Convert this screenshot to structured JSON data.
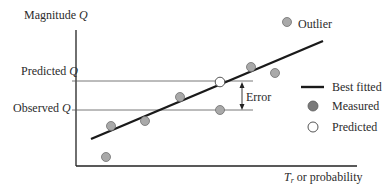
{
  "diagram": {
    "y_axis_label": "Magnitude",
    "y_axis_var": "Q",
    "x_axis_label_var": "T",
    "x_axis_label_sub": "r",
    "x_axis_label_rest": " or probability",
    "predicted_q_label": "Predicted",
    "observed_q_label": "Observed",
    "q_var": "Q",
    "error_label": "Error",
    "outlier_label": "Outlier",
    "legend": {
      "best_fitted": "Best fitted",
      "measured": "Measured",
      "predicted": "Predicted"
    },
    "colors": {
      "measured_fill": "#a9a9a9",
      "measured_stroke": "#6e6e6e",
      "line": "#1a1a1a",
      "guide": "#555555"
    }
  }
}
